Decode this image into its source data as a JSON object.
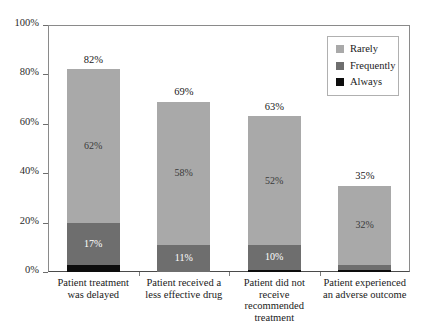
{
  "chart_data": {
    "type": "bar",
    "subtype": "stacked-bar",
    "title": "",
    "xlabel": "",
    "ylabel": "",
    "ylim": [
      0,
      100
    ],
    "ytick_labels": [
      "0%",
      "20%",
      "40%",
      "60%",
      "80%",
      "100%"
    ],
    "ytick_values": [
      0,
      20,
      40,
      60,
      80,
      100
    ],
    "grid": false,
    "legend_position": "top-right",
    "categories": [
      "Patient treatment was delayed",
      "Patient received a less effective drug",
      "Patient did not receive recommended treatment",
      "Patient experienced an adverse outcome"
    ],
    "category_lines": [
      [
        "Patient treatment",
        "was delayed"
      ],
      [
        "Patient received a",
        "less effective drug"
      ],
      [
        "Patient did not",
        "receive",
        "recommended",
        "treatment"
      ],
      [
        "Patient experienced",
        "an adverse outcome"
      ]
    ],
    "series": [
      {
        "name": "Rarely",
        "color": "#a9a9a9",
        "values": [
          62,
          58,
          52,
          32
        ],
        "labels": [
          "62%",
          "58%",
          "52%",
          "32%"
        ]
      },
      {
        "name": "Frequently",
        "color": "#6e6e6e",
        "values": [
          17,
          11,
          10,
          2
        ],
        "labels": [
          "17%",
          "11%",
          "10%",
          ""
        ]
      },
      {
        "name": "Always",
        "color": "#0d0d0d",
        "values": [
          3,
          0,
          1,
          1
        ],
        "labels": [
          "",
          "",
          "",
          ""
        ]
      }
    ],
    "totals": [
      82,
      69,
      63,
      35
    ],
    "total_labels": [
      "82%",
      "69%",
      "63%",
      "35%"
    ]
  },
  "legend": {
    "items": [
      {
        "label": "Rarely",
        "color": "#a9a9a9"
      },
      {
        "label": "Frequently",
        "color": "#6e6e6e"
      },
      {
        "label": "Always",
        "color": "#0d0d0d"
      }
    ]
  }
}
